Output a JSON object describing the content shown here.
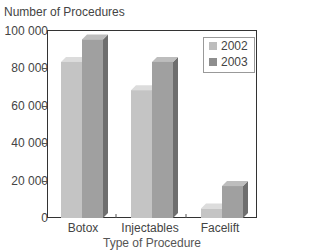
{
  "chart_data": {
    "type": "bar",
    "title": "",
    "ylabel": "Number of Procedures",
    "xlabel": "Type of Procedure",
    "categories": [
      "Botox",
      "Injectables",
      "Facelift"
    ],
    "series": [
      {
        "name": "2002",
        "values": [
          83000,
          68000,
          5000
        ],
        "color": "#bdbdbd"
      },
      {
        "name": "2003",
        "values": [
          95000,
          83000,
          17000
        ],
        "color": "#9a9a9a"
      }
    ],
    "ylim": [
      0,
      100000
    ],
    "yticks": [
      "0",
      "20 000",
      "40 000",
      "60 000",
      "80 000",
      "100 000"
    ],
    "grid": false,
    "legend_position": "top-right",
    "style": "3d-bar"
  },
  "labels": {
    "y_title": "Number of Procedures",
    "x_title": "Type of Procedure",
    "legend": [
      "2002",
      "2003"
    ]
  }
}
